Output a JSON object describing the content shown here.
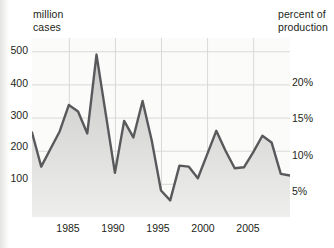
{
  "axes": {
    "left_caption": "million\ncases",
    "right_caption": "percent of\nproduction",
    "left_ticks": [
      "500",
      "400",
      "300",
      "200",
      "100"
    ],
    "right_ticks": [
      "20%",
      "15%",
      "10%",
      "5%"
    ],
    "x_ticks": [
      "1985",
      "1990",
      "1995",
      "2000",
      "2005"
    ]
  },
  "style": {
    "line_color": "#58595b",
    "fill_top": "#c9c9c7",
    "fill_bottom": "#eeeeec",
    "grid_color": "#d9d9d6",
    "plot_bg": "#fbfbfa",
    "text_color": "#231f20"
  },
  "chart_data": {
    "type": "area",
    "title": "",
    "xlabel": "",
    "ylabel": "million cases",
    "y2label": "percent of production",
    "grid": true,
    "legend": "none",
    "xlim": [
      1981,
      2009
    ],
    "ylim": [
      0,
      540
    ],
    "y2lim": [
      0,
      27
    ],
    "yticks": [
      100,
      200,
      300,
      400,
      500
    ],
    "y2ticks": [
      5,
      10,
      15,
      20
    ],
    "xticks": [
      1985,
      1990,
      1995,
      2000,
      2005
    ],
    "x": [
      1981,
      1982,
      1983,
      1984,
      1985,
      1986,
      1987,
      1988,
      1989,
      1990,
      1991,
      1992,
      1993,
      1994,
      1995,
      1996,
      1997,
      1998,
      1999,
      2000,
      2001,
      2002,
      2003,
      2004,
      2005,
      2006,
      2007,
      2008,
      2009
    ],
    "series": [
      {
        "name": "million cases",
        "units": "million cases",
        "values": [
          255,
          152,
          205,
          258,
          338,
          318,
          252,
          490,
          312,
          133,
          290,
          240,
          350,
          230,
          80,
          50,
          155,
          152,
          117,
          188,
          260,
          200,
          147,
          150,
          195,
          245,
          225,
          130,
          125
        ]
      }
    ]
  }
}
